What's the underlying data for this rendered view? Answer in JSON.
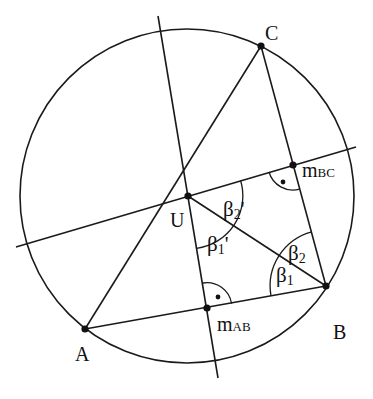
{
  "diagram": {
    "title": "",
    "stroke_color": "#1a1a1a",
    "background": "#ffffff",
    "circle": {
      "cx": 187,
      "cy": 196,
      "r": 167
    },
    "points": {
      "A": {
        "x": 85,
        "y": 329,
        "label": "A"
      },
      "B": {
        "x": 326,
        "y": 286,
        "label": "B"
      },
      "C": {
        "x": 261,
        "y": 46,
        "label": "C"
      },
      "U": {
        "x": 188,
        "y": 196,
        "label": "U"
      },
      "mAB": {
        "x": 207,
        "y": 308,
        "label_main": "m",
        "label_sub": "AB"
      },
      "mBC": {
        "x": 293,
        "y": 165,
        "label_main": "m",
        "label_sub": "BC"
      }
    },
    "lines": {
      "bisector_AB": {
        "x1": 158,
        "y1": 16,
        "x2": 218,
        "y2": 378
      },
      "bisector_BC": {
        "x1": 16,
        "y1": 247,
        "x2": 356,
        "y2": 147
      }
    },
    "angle_labels": {
      "beta1": {
        "main": "β",
        "sub": "1",
        "prime": ""
      },
      "beta2": {
        "main": "β",
        "sub": "2",
        "prime": ""
      },
      "beta1p": {
        "main": "β",
        "sub": "1",
        "prime": "'"
      },
      "beta2p": {
        "main": "β",
        "sub": "2",
        "prime": "'"
      }
    },
    "right_angle_marks": [
      "at mAB",
      "at mBC"
    ]
  }
}
